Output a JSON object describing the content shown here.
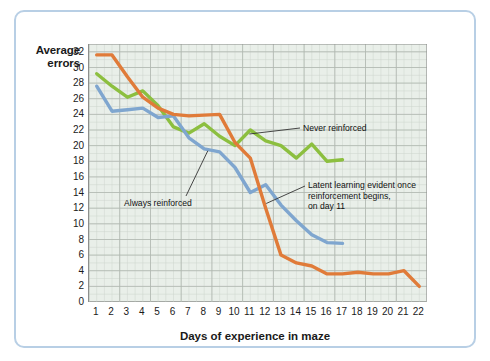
{
  "figure": {
    "frame_color": "#b8cfe5",
    "plot_bg": "#e9efe9",
    "grid_color": "#c4cbc4"
  },
  "axes": {
    "ylabel": "Average\nerrors",
    "xlabel": "Days of experience in maze",
    "yticks": [
      0,
      2,
      4,
      6,
      8,
      10,
      12,
      14,
      16,
      18,
      20,
      22,
      24,
      26,
      28,
      30,
      32
    ],
    "xticks": [
      1,
      2,
      3,
      4,
      5,
      6,
      7,
      8,
      9,
      10,
      11,
      12,
      13,
      14,
      15,
      16,
      17,
      18,
      19,
      20,
      21,
      22
    ]
  },
  "annotations": {
    "never": "Never reinforced",
    "always": "Always reinforced",
    "latent": "Latent learning evident once\nreinforcement begins,\non day 11"
  },
  "chart_data": {
    "type": "line",
    "title": "",
    "xlabel": "Days of experience in maze",
    "ylabel": "Average errors",
    "xlim": [
      0.5,
      22.5
    ],
    "ylim": [
      0,
      33
    ],
    "grid": true,
    "legend": "inline-annotations",
    "x": [
      1,
      2,
      3,
      4,
      5,
      6,
      7,
      8,
      9,
      10,
      11,
      12,
      13,
      14,
      15,
      16,
      17,
      18,
      19,
      20,
      21,
      22
    ],
    "series": [
      {
        "name": "Never reinforced",
        "color": "#8cbf3f",
        "label_text": "Never reinforced",
        "x": [
          1,
          2,
          3,
          4,
          5,
          6,
          7,
          8,
          9,
          10,
          11,
          12,
          13,
          14,
          15,
          16,
          17
        ],
        "values": [
          29.2,
          27.6,
          26.2,
          27.0,
          25.1,
          22.4,
          21.6,
          22.8,
          21.2,
          20.0,
          22.0,
          20.6,
          20.0,
          18.4,
          20.2,
          18.0,
          18.2
        ]
      },
      {
        "name": "Always reinforced",
        "color": "#7fa6cf",
        "label_text": "Always reinforced",
        "x": [
          1,
          2,
          3,
          4,
          5,
          6,
          7,
          8,
          9,
          10,
          11,
          12,
          13,
          14,
          15,
          16,
          17
        ],
        "values": [
          27.6,
          24.4,
          24.6,
          24.8,
          23.6,
          23.8,
          21.0,
          19.6,
          19.2,
          17.2,
          14.0,
          15.0,
          12.4,
          10.4,
          8.6,
          7.6,
          7.5
        ]
      },
      {
        "name": "Latent learning (reinforced from day 11)",
        "color": "#e07b39",
        "label_text": "Latent learning evident once reinforcement begins, on day 11",
        "x": [
          1,
          2,
          3,
          4,
          5,
          6,
          7,
          8,
          9,
          10,
          11,
          12,
          13,
          14,
          15,
          16,
          17,
          18,
          19,
          20,
          21,
          22
        ],
        "values": [
          31.6,
          31.6,
          28.8,
          26.2,
          24.8,
          24.0,
          23.8,
          23.9,
          24.0,
          20.4,
          18.4,
          12.0,
          6.0,
          5.0,
          4.6,
          3.6,
          3.6,
          3.8,
          3.6,
          3.6,
          4.0,
          2.0
        ]
      }
    ]
  }
}
